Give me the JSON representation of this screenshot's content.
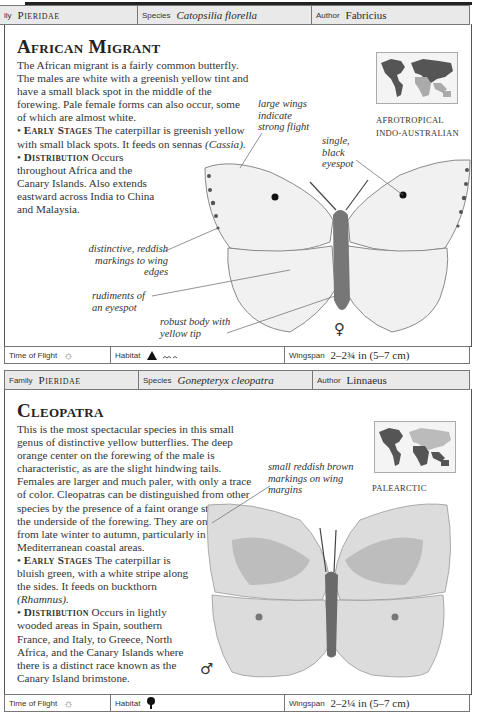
{
  "entries": [
    {
      "header": {
        "family_label": "Family",
        "family_label_visible": "ily",
        "family": "Pieridae",
        "species_label": "Species",
        "species": "Catopsilia florella",
        "author_label": "Author",
        "author": "Fabricius"
      },
      "title": "African Migrant",
      "intro": "The African migrant is a fairly common butterfly. The males are white with a greenish yellow tint and have a small black spot in the middle of the forewing. Pale female forms can also occur, some of which are almost white.",
      "early_stages_label": "Early Stages",
      "early_stages": "The caterpillar is greenish yellow with small black spots. It feeds on sennas",
      "early_stages_plant": "(Cassia).",
      "distribution_label": "Distribution",
      "distribution": "Occurs throughout Africa and the Canary Islands. Also extends eastward across India to China and Malaysia.",
      "map_regions": [
        "AFROTROPICAL",
        "INDO-AUSTRALIAN"
      ],
      "annotations": [
        "large wings indicate strong flight",
        "single, black eyespot",
        "distinctive, reddish markings to wing edges",
        "rudiments of an eyespot",
        "robust body with yellow tip"
      ],
      "sex_symbol": "♀",
      "footer": {
        "time_label": "Time of Flight",
        "time_icon": "sun-icon",
        "habitat_label": "Habitat",
        "habitat_icons": [
          "mountain-icon",
          "hills-icon"
        ],
        "wingspan_label": "Wingspan",
        "wingspan": "2–2¾ in (5–7 cm)"
      }
    },
    {
      "header": {
        "family_label": "Family",
        "family": "Pieridae",
        "species_label": "Species",
        "species": "Gonepteryx cleopatra",
        "author_label": "Author",
        "author": "Linnaeus"
      },
      "title": "Cleopatra",
      "intro": "This is the most spectacular species in this small genus of distinctive yellow butterflies. The deep orange center on the forewing of the male is characteristic, as are the slight hindwing tails. Females are larger and much paler, with only a trace of color. Cleopatras can be distinguished from other species by the presence of a faint orange streak on the underside of the forewing. They are on the wing from late winter to autumn, particularly in Mediterranean coastal areas.",
      "early_stages_label": "Early Stages",
      "early_stages": "The caterpillar is bluish green, with a white stripe along the sides. It feeds on buckthorn",
      "early_stages_plant": "(Rhamnus).",
      "distribution_label": "Distribution",
      "distribution": "Occurs in lightly wooded areas in Spain, southern France, and Italy, to Greece, North Africa, and the Canary Islands where there is a distinct race known as the Canary Island brimstone.",
      "map_regions": [
        "PALEARCTIC"
      ],
      "annotations": [
        "small reddish brown markings on wing margins"
      ],
      "sex_symbol": "♂",
      "footer": {
        "time_label": "Time of Flight",
        "time_icon": "sun-icon",
        "habitat_label": "Habitat",
        "habitat_icons": [
          "tree-icon"
        ],
        "wingspan_label": "Wingspan",
        "wingspan": "2–2¼ in (5–7 cm)"
      }
    }
  ]
}
